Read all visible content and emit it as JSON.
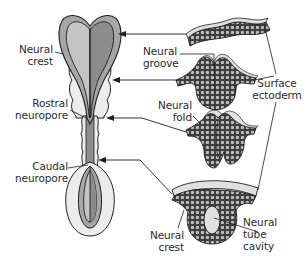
{
  "diagram": {
    "colors": {
      "outline": "#1e1e1e",
      "neural_plate_light": "#c4c4c4",
      "neural_plate_dark": "#8c8c8c",
      "neural_crest_band": "#a6a6a6",
      "somite_fill": "#ececec",
      "tissue_cells": "#5a5a5a",
      "surface_ectoderm": "#e0e0e0",
      "background": "#ffffff"
    },
    "labels": {
      "neural_crest_left": [
        "Neural",
        "crest"
      ],
      "rostral_neuropore": [
        "Rostral",
        "neuropore"
      ],
      "caudal_neuropore": [
        "Caudal",
        "neuropore"
      ],
      "neural_groove": [
        "Neural",
        "groove"
      ],
      "neural_fold": [
        "Neural",
        "fold"
      ],
      "surface_ectoderm": [
        "Surface",
        "ectoderm"
      ],
      "neural_crest_bottom": [
        "Neural",
        "crest"
      ],
      "neural_tube_cavity": [
        "Neural",
        "tube",
        "cavity"
      ]
    },
    "stages": [
      {
        "name": "neural-plate",
        "order": 1
      },
      {
        "name": "neural-groove",
        "order": 2
      },
      {
        "name": "neural-fold",
        "order": 3
      },
      {
        "name": "neural-tube",
        "order": 4
      }
    ]
  }
}
